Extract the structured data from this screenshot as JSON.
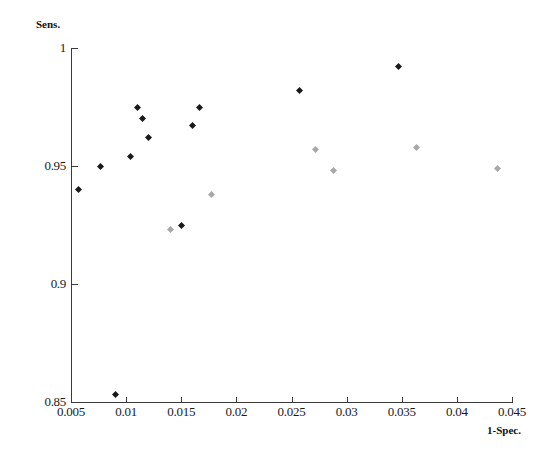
{
  "chart_data": {
    "type": "scatter",
    "title": "",
    "xlabel": "1-Spec.",
    "ylabel": "Sens.",
    "xlim": [
      0.005,
      0.045
    ],
    "ylim": [
      0.85,
      1.0
    ],
    "xticks": [
      0.005,
      0.01,
      0.015,
      0.02,
      0.025,
      0.03,
      0.035,
      0.04,
      0.045
    ],
    "xtick_labels": [
      "0.005",
      "0.01",
      "0.015",
      "0.02",
      "0.025",
      "0.03",
      "0.035",
      "0.04",
      "0.045"
    ],
    "yticks": [
      0.85,
      0.9,
      0.95,
      1
    ],
    "ytick_labels": [
      "0.85",
      "0.9",
      "0.95",
      "1"
    ],
    "grid": false,
    "legend": "none",
    "series": [
      {
        "name": "dark-markers",
        "color": "#1a1a1a",
        "marker": "diamond",
        "points": [
          {
            "x": 0.0057,
            "y": 0.94
          },
          {
            "x": 0.0077,
            "y": 0.95
          },
          {
            "x": 0.009,
            "y": 0.853
          },
          {
            "x": 0.0104,
            "y": 0.954
          },
          {
            "x": 0.011,
            "y": 0.975
          },
          {
            "x": 0.0115,
            "y": 0.97
          },
          {
            "x": 0.012,
            "y": 0.962
          },
          {
            "x": 0.015,
            "y": 0.925
          },
          {
            "x": 0.016,
            "y": 0.967
          },
          {
            "x": 0.0167,
            "y": 0.975
          },
          {
            "x": 0.0257,
            "y": 0.982
          },
          {
            "x": 0.0347,
            "y": 0.992
          }
        ]
      },
      {
        "name": "light-markers",
        "color": "#a8a8a8",
        "marker": "diamond",
        "points": [
          {
            "x": 0.014,
            "y": 0.923
          },
          {
            "x": 0.0177,
            "y": 0.938
          },
          {
            "x": 0.0272,
            "y": 0.957
          },
          {
            "x": 0.0288,
            "y": 0.948
          },
          {
            "x": 0.0363,
            "y": 0.958
          },
          {
            "x": 0.0437,
            "y": 0.949
          }
        ]
      }
    ]
  },
  "axes": {
    "y_title": "Sens.",
    "x_title": "1-Spec."
  },
  "colors": {
    "axis": "#3a3a3a",
    "dark_marker": "#1a1a1a",
    "light_marker": "#a8a8a8",
    "background": "#ffffff"
  }
}
